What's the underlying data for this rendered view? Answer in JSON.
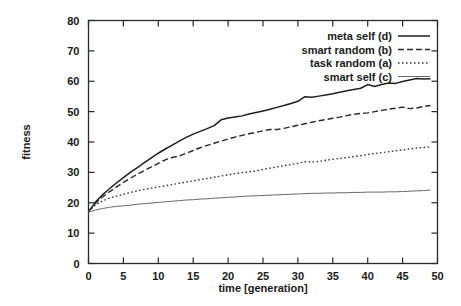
{
  "chart_data": {
    "type": "line",
    "title": "",
    "xlabel": "time [generation]",
    "ylabel": "fitness",
    "xlim": [
      0,
      50
    ],
    "ylim": [
      0,
      80
    ],
    "xticks": [
      0,
      5,
      10,
      15,
      20,
      25,
      30,
      35,
      40,
      45,
      50
    ],
    "yticks": [
      0,
      10,
      20,
      30,
      40,
      50,
      60,
      70,
      80
    ],
    "grid": false,
    "legend_position": "top-right",
    "x": [
      0,
      1,
      2,
      3,
      4,
      5,
      6,
      7,
      8,
      9,
      10,
      11,
      12,
      13,
      14,
      15,
      16,
      17,
      18,
      19,
      20,
      21,
      22,
      23,
      24,
      25,
      26,
      27,
      28,
      29,
      30,
      31,
      32,
      33,
      34,
      35,
      36,
      37,
      38,
      39,
      40,
      41,
      42,
      43,
      44,
      45,
      46,
      47,
      48,
      49
    ],
    "series": [
      {
        "name": "meta self (d)",
        "style": "solid",
        "color": "#1f1f1f",
        "values": [
          17.0,
          20.2,
          22.6,
          24.6,
          26.5,
          28.3,
          30.0,
          31.6,
          33.2,
          34.8,
          36.3,
          37.7,
          39.0,
          40.3,
          41.5,
          42.6,
          43.5,
          44.4,
          45.4,
          47.3,
          47.9,
          48.2,
          48.6,
          49.2,
          49.7,
          50.2,
          50.8,
          51.4,
          52.0,
          52.7,
          53.4,
          54.9,
          54.7,
          55.1,
          55.5,
          55.9,
          56.4,
          56.9,
          57.3,
          57.7,
          58.9,
          58.3,
          58.9,
          59.4,
          59.3,
          59.9,
          60.4,
          60.9,
          60.7,
          60.8
        ]
      },
      {
        "name": "smart random (b)",
        "style": "dashed",
        "color": "#2a2a2a",
        "values": [
          17.2,
          19.8,
          21.9,
          23.6,
          25.2,
          26.7,
          28.1,
          29.4,
          30.6,
          31.8,
          33.0,
          34.1,
          34.9,
          35.4,
          36.3,
          37.2,
          38.1,
          38.9,
          39.6,
          40.3,
          41.0,
          41.6,
          42.2,
          42.7,
          43.2,
          43.7,
          44.1,
          44.1,
          44.5,
          45.0,
          45.5,
          46.0,
          46.5,
          47.0,
          47.4,
          47.8,
          48.2,
          48.7,
          49.1,
          49.4,
          49.6,
          50.0,
          50.4,
          50.8,
          51.1,
          51.5,
          51.0,
          51.2,
          51.7,
          52.0
        ]
      },
      {
        "name": "task random (a)",
        "style": "dotted",
        "color": "#3a3a3a",
        "values": [
          17.0,
          19.3,
          20.6,
          21.5,
          22.2,
          22.8,
          23.4,
          23.9,
          24.4,
          24.8,
          25.2,
          25.6,
          26.0,
          26.4,
          26.8,
          27.2,
          27.6,
          28.0,
          28.4,
          28.8,
          29.2,
          29.6,
          29.9,
          30.2,
          30.5,
          31.0,
          31.4,
          31.8,
          32.2,
          32.6,
          33.0,
          33.5,
          33.4,
          33.6,
          34.0,
          34.3,
          34.6,
          34.9,
          35.2,
          35.5,
          35.9,
          36.2,
          36.5,
          36.8,
          37.1,
          37.4,
          37.7,
          38.0,
          38.2,
          38.4
        ]
      },
      {
        "name": "smart self (c)",
        "style": "fine",
        "color": "#6a6a6a",
        "values": [
          16.9,
          17.6,
          18.1,
          18.5,
          18.8,
          19.0,
          19.2,
          19.5,
          19.7,
          19.9,
          20.1,
          20.3,
          20.5,
          20.7,
          20.9,
          21.0,
          21.2,
          21.3,
          21.5,
          21.6,
          21.8,
          21.9,
          22.1,
          22.2,
          22.3,
          22.4,
          22.5,
          22.6,
          22.7,
          22.8,
          22.9,
          23.0,
          23.1,
          23.1,
          23.2,
          23.2,
          23.3,
          23.3,
          23.4,
          23.4,
          23.5,
          23.5,
          23.5,
          23.6,
          23.6,
          23.7,
          23.8,
          23.9,
          24.0,
          24.2
        ]
      }
    ]
  },
  "legend": {
    "items": [
      {
        "label": "meta self (d)"
      },
      {
        "label": "smart random (b)"
      },
      {
        "label": "task random (a)"
      },
      {
        "label": "smart self (c)"
      }
    ]
  },
  "axes": {
    "x_label": "time [generation]",
    "y_label": "fitness",
    "x_tick_labels": [
      "0",
      "5",
      "10",
      "15",
      "20",
      "25",
      "30",
      "35",
      "40",
      "45",
      "50"
    ],
    "y_tick_labels": [
      "0",
      "10",
      "20",
      "30",
      "40",
      "50",
      "60",
      "70",
      "80"
    ]
  }
}
